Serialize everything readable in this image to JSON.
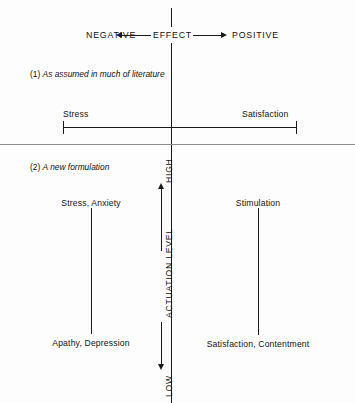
{
  "figure": {
    "title_axis": {
      "center_label": "EFFECT",
      "left_label": "NEGATIVE",
      "right_label": "POSITIVE"
    },
    "sections": [
      {
        "id": "section-1",
        "caption_number": "(1)",
        "caption_text": "As assumed in much of literature",
        "scale": {
          "left_label": "Stress",
          "right_label": "Satisfaction"
        }
      },
      {
        "id": "section-2",
        "caption_number": "(2)",
        "caption_text": "A new formulation",
        "vertical_axis": {
          "name": "ACTUATION LEVEL",
          "top_label": "HIGH",
          "bottom_label": "LOW"
        },
        "quadrant_labels": {
          "negative_high": "Stress, Anxiety",
          "negative_low": "Apathy, Depression",
          "positive_high": "Stimulation",
          "positive_low": "Satisfaction, Contentment"
        }
      }
    ],
    "colors": {
      "ink": "#1a1a1a",
      "separator": "#8d8d8d",
      "background": "#fdfdfd"
    }
  }
}
